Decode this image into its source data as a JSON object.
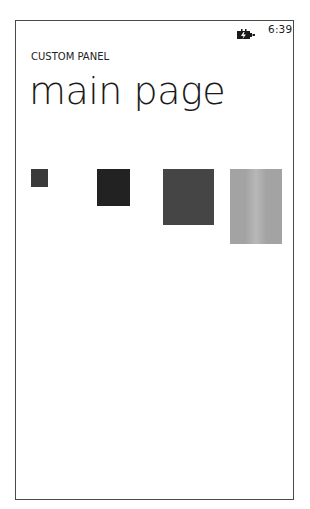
{
  "status_bar": {
    "battery_icon": "battery-charging-icon",
    "time": "6:39"
  },
  "header": {
    "app_title": "CUSTOM PANEL",
    "page_title": "main page"
  },
  "custom_panel": {
    "items": [
      {
        "name": "square-1",
        "color": "#3a3a3a"
      },
      {
        "name": "square-2",
        "color": "#222222"
      },
      {
        "name": "square-3",
        "color": "#454545"
      },
      {
        "name": "square-4",
        "color": "#a3a3a3",
        "highlight": "#b8b8b8"
      }
    ]
  },
  "colors": {
    "background": "#ffffff",
    "frame_border": "#4a4a4a",
    "text": "#1a1a1a"
  }
}
